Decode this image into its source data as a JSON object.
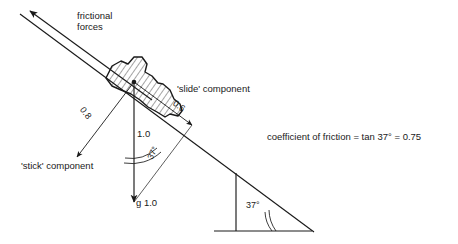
{
  "figure": {
    "background_color": "#ffffff",
    "line_color": "#1a1a1a",
    "text_color": "#1a1a1a"
  },
  "labels": {
    "frictional_forces_line1": "frictional",
    "frictional_forces_line2": "forces",
    "slide_component": "'slide' component",
    "stick_component": "'stick' component",
    "normal_magnitude": "0.8",
    "slide_magnitude": "0.6",
    "weight_magnitude": "1.0",
    "weight_vector": "g 1.0",
    "vector_angle": "37°",
    "triangle_angle": "37°",
    "coefficient_text": "coefficient of friction = tan 37° = 0.75"
  },
  "physics_data": {
    "incline_angle_degrees": 37,
    "coefficient_of_friction": 0.75,
    "weight": 1.0,
    "component_along_slope": 0.6,
    "component_normal_to_slope": 0.8,
    "relation": "tan 37° = 0.75"
  },
  "geometry": {
    "slope_line": {
      "x1": 20,
      "y1": 14,
      "x2": 314,
      "y2": 232
    },
    "friction_arrow": {
      "x1": 150,
      "y1": 98,
      "x2": 27,
      "y2": 9
    },
    "weight_vector": {
      "x1": 134,
      "y1": 82,
      "x2": 134,
      "y2": 204
    },
    "stick_vector": {
      "x1": 134,
      "y1": 82,
      "x2": 76,
      "y2": 158
    },
    "slide_vector": {
      "x1": 134,
      "y1": 82,
      "x2": 193,
      "y2": 126
    },
    "triangle": {
      "apex_x": 236,
      "apex_y": 173,
      "right_x": 312,
      "right_y": 231,
      "base_x": 236,
      "base_y": 231
    }
  }
}
